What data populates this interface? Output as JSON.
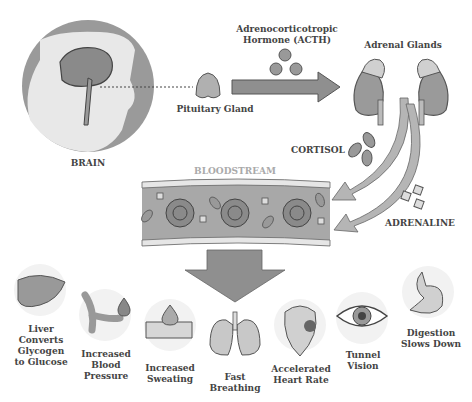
{
  "diagram": {
    "brain_label": "BRAIN",
    "pituitary_label": "Pituitary Gland",
    "acth_label_line1": "Adrenocorticotropic",
    "acth_label_line2": "Hormone (ACTH)",
    "adrenal_label": "Adrenal Glands",
    "cortisol_label": "CORTISOL",
    "bloodstream_label": "BLOODSTREAM",
    "adrenaline_label": "ADRENALINE"
  },
  "effects": [
    {
      "line1": "Liver",
      "line2": "Converts",
      "line3": "Glycogen",
      "line4": "to Glucose",
      "icon": "liver-icon"
    },
    {
      "line1": "Increased",
      "line2": "Blood",
      "line3": "Pressure",
      "icon": "blood-vessel-icon"
    },
    {
      "line1": "Increased",
      "line2": "Sweating",
      "icon": "sweat-drop-icon"
    },
    {
      "line1": "Fast",
      "line2": "Breathing",
      "icon": "lungs-icon"
    },
    {
      "line1": "Accelerated",
      "line2": "Heart Rate",
      "icon": "heart-icon"
    },
    {
      "line1": "Tunnel",
      "line2": "Vision",
      "icon": "eye-icon"
    },
    {
      "line1": "Digestion",
      "line2": "Slows Down",
      "icon": "stomach-icon"
    }
  ]
}
